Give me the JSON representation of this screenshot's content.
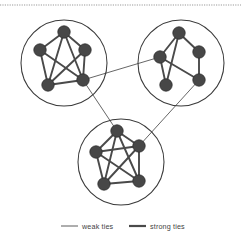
{
  "figure": {
    "background_color": "#ffffff",
    "node_color": "#474747",
    "node_stroke_color": "#2e2e2e",
    "strong_tie_color": "#4a4a4a",
    "weak_tie_color": "#4a4a4a",
    "cluster_outline_color": "#3a3a3a",
    "top_rule_color": "#9a9a9a"
  },
  "legend": {
    "items": [
      {
        "label": "weak ties",
        "style": "thin",
        "color": "#4a4a4a",
        "width": 0.9
      },
      {
        "label": "strong ties",
        "style": "thick",
        "color": "#4a4a4a",
        "width": 2.2
      }
    ]
  },
  "chart_data": {
    "type": "diagram",
    "clusters": [
      {
        "id": "cluster-top-left",
        "label": "top-left cluster",
        "circle": {
          "cx": 64,
          "cy": 63,
          "r": 43
        },
        "nodes": [
          {
            "id": "A1",
            "x": 64,
            "y": 32,
            "r": 6.2
          },
          {
            "id": "A2",
            "x": 40,
            "y": 50,
            "r": 6.2
          },
          {
            "id": "A3",
            "x": 85,
            "y": 50,
            "r": 6.2
          },
          {
            "id": "A4",
            "x": 48,
            "y": 85,
            "r": 6.2
          },
          {
            "id": "A5",
            "x": 83,
            "y": 80,
            "r": 6.2
          }
        ],
        "edges": [
          {
            "from": "A1",
            "to": "A2",
            "tie": "strong"
          },
          {
            "from": "A1",
            "to": "A3",
            "tie": "strong"
          },
          {
            "from": "A1",
            "to": "A4",
            "tie": "strong"
          },
          {
            "from": "A1",
            "to": "A5",
            "tie": "strong"
          },
          {
            "from": "A2",
            "to": "A4",
            "tie": "strong"
          },
          {
            "from": "A2",
            "to": "A5",
            "tie": "strong"
          },
          {
            "from": "A3",
            "to": "A5",
            "tie": "strong"
          },
          {
            "from": "A3",
            "to": "A4",
            "tie": "strong"
          },
          {
            "from": "A4",
            "to": "A5",
            "tie": "strong"
          }
        ]
      },
      {
        "id": "cluster-top-right",
        "label": "top-right cluster",
        "circle": {
          "cx": 181,
          "cy": 63,
          "r": 43
        },
        "nodes": [
          {
            "id": "B1",
            "x": 179,
            "y": 33,
            "r": 6.2
          },
          {
            "id": "B2",
            "x": 160,
            "y": 57,
            "r": 6.2
          },
          {
            "id": "B3",
            "x": 199,
            "y": 52,
            "r": 6.2
          },
          {
            "id": "B4",
            "x": 166,
            "y": 85,
            "r": 6.2
          },
          {
            "id": "B5",
            "x": 199,
            "y": 80,
            "r": 6.2
          }
        ],
        "edges": [
          {
            "from": "B1",
            "to": "B2",
            "tie": "strong"
          },
          {
            "from": "B1",
            "to": "B3",
            "tie": "strong"
          },
          {
            "from": "B1",
            "to": "B4",
            "tie": "strong"
          },
          {
            "from": "B2",
            "to": "B4",
            "tie": "strong"
          },
          {
            "from": "B2",
            "to": "B5",
            "tie": "strong"
          },
          {
            "from": "B3",
            "to": "B5",
            "tie": "strong"
          }
        ]
      },
      {
        "id": "cluster-bottom",
        "label": "bottom cluster",
        "circle": {
          "cx": 121,
          "cy": 162,
          "r": 43
        },
        "nodes": [
          {
            "id": "C1",
            "x": 117,
            "y": 131,
            "r": 6.2
          },
          {
            "id": "C2",
            "x": 96,
            "y": 152,
            "r": 6.2
          },
          {
            "id": "C3",
            "x": 139,
            "y": 146,
            "r": 6.2
          },
          {
            "id": "C4",
            "x": 104,
            "y": 184,
            "r": 6.2
          },
          {
            "id": "C5",
            "x": 139,
            "y": 181,
            "r": 6.2
          }
        ],
        "edges": [
          {
            "from": "C1",
            "to": "C2",
            "tie": "strong"
          },
          {
            "from": "C1",
            "to": "C3",
            "tie": "strong"
          },
          {
            "from": "C1",
            "to": "C4",
            "tie": "strong"
          },
          {
            "from": "C1",
            "to": "C5",
            "tie": "strong"
          },
          {
            "from": "C2",
            "to": "C3",
            "tie": "strong"
          },
          {
            "from": "C2",
            "to": "C4",
            "tie": "strong"
          },
          {
            "from": "C2",
            "to": "C5",
            "tie": "strong"
          },
          {
            "from": "C3",
            "to": "C4",
            "tie": "strong"
          },
          {
            "from": "C3",
            "to": "C5",
            "tie": "strong"
          },
          {
            "from": "C4",
            "to": "C5",
            "tie": "strong"
          }
        ]
      }
    ],
    "bridges": [
      {
        "id": "bridge-left-right",
        "from": "A5",
        "to": "B2",
        "tie": "weak"
      },
      {
        "id": "bridge-left-bottom",
        "from": "A5",
        "to": "C1",
        "tie": "weak"
      },
      {
        "id": "bridge-right-bottom",
        "from": "B5",
        "to": "C3",
        "tie": "weak"
      }
    ],
    "legend_position": "bottom-center"
  }
}
